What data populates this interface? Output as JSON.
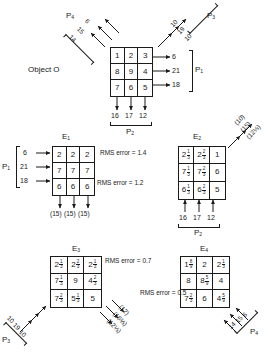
{
  "figure": {
    "object_label": "Object O",
    "object_grid": {
      "name": "O",
      "rows": [
        [
          "1",
          "2",
          "3"
        ],
        [
          "8",
          "9",
          "4"
        ],
        [
          "7",
          "6",
          "5"
        ]
      ]
    },
    "projections": {
      "p1": {
        "label": "P",
        "sub": "1",
        "values": [
          "6",
          "21",
          "18"
        ]
      },
      "p2": {
        "label": "P",
        "sub": "2",
        "values": [
          "16",
          "17",
          "12"
        ]
      },
      "p3": {
        "label": "P",
        "sub": "3",
        "values": [
          "10",
          "19",
          "10"
        ]
      },
      "p4": {
        "label": "P",
        "sub": "4",
        "values": [
          "14",
          "15",
          "6"
        ]
      }
    },
    "estimates": [
      {
        "name": "E",
        "sub": "1",
        "rms_label": "RMS error = 1.4",
        "cells": [
          [
            {
              "w": "2"
            },
            {
              "w": "2"
            },
            {
              "w": "2"
            }
          ],
          [
            {
              "w": "7"
            },
            {
              "w": "7"
            },
            {
              "w": "7"
            }
          ],
          [
            {
              "w": "6"
            },
            {
              "w": "6"
            },
            {
              "w": "6"
            }
          ]
        ],
        "in_label": "P",
        "in_sub": "1",
        "in_values": [
          "6",
          "21",
          "18"
        ],
        "out_values": [
          "(15)",
          "(15)",
          "(15)"
        ]
      },
      {
        "name": "E",
        "sub": "2",
        "rms_label": "RMS error = 1.2",
        "cells": [
          [
            {
              "w": "2",
              "n": "1",
              "d": "3"
            },
            {
              "w": "2",
              "n": "2",
              "d": "3"
            },
            {
              "w": "1"
            }
          ],
          [
            {
              "w": "7",
              "n": "1",
              "d": "3"
            },
            {
              "w": "7",
              "n": "2",
              "d": "3"
            },
            {
              "w": "6"
            }
          ],
          [
            {
              "w": "6",
              "n": "1",
              "d": "3"
            },
            {
              "w": "6",
              "n": "2",
              "d": "3"
            },
            {
              "w": "5"
            }
          ]
        ],
        "in_label": "P",
        "in_sub": "2",
        "in_values": [
          "16",
          "17",
          "12"
        ],
        "out_values": [
          "(10)",
          "(15)",
          "(12⅓)"
        ]
      },
      {
        "name": "E",
        "sub": "3",
        "rms_label": "RMS error = 0.7",
        "cells": [
          [
            {
              "w": "2",
              "n": "1",
              "d": "3"
            },
            {
              "w": "2",
              "n": "2",
              "d": "3"
            },
            {
              "w": "2",
              "n": "1",
              "d": "3"
            }
          ],
          [
            {
              "w": "7",
              "n": "1",
              "d": "3"
            },
            {
              "w": "9"
            },
            {
              "w": "4",
              "n": "2",
              "d": "3"
            }
          ],
          [
            {
              "w": "7",
              "n": "2",
              "d": "3"
            },
            {
              "w": "5",
              "n": "1",
              "d": "3"
            },
            {
              "w": "5"
            }
          ]
        ],
        "in_label": "P",
        "in_sub": "3",
        "in_values": [
          "10",
          "19",
          "10"
        ],
        "out_values": [
          "(12)",
          "(16⅔)",
          "(12⅓)"
        ]
      },
      {
        "name": "E",
        "sub": "4",
        "rms_label": "RMS error = 0.5",
        "cells": [
          [
            {
              "w": "1",
              "n": "8",
              "d": "9"
            },
            {
              "w": "2"
            },
            {
              "w": "2",
              "n": "1",
              "d": "3"
            }
          ],
          [
            {
              "w": "8"
            },
            {
              "w": "8",
              "n": "5",
              "d": "9"
            },
            {
              "w": "4"
            }
          ],
          [
            {
              "w": "7",
              "n": "2",
              "d": "3"
            },
            {
              "w": "6"
            },
            {
              "w": "4",
              "n": "5",
              "d": "9"
            }
          ]
        ],
        "in_label": "P",
        "in_sub": "4",
        "in_values": [
          "14",
          "15",
          "6"
        ],
        "out_values": []
      }
    ],
    "colors": {
      "ink": "#1a1a1a",
      "paper": "#ffffff"
    }
  }
}
